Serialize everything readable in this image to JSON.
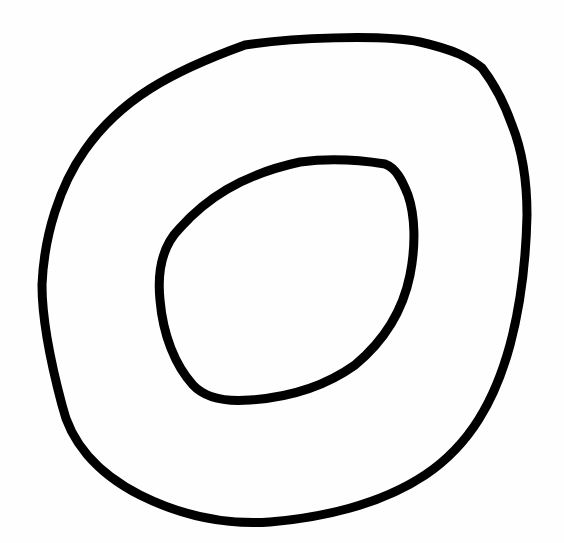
{
  "drawing": {
    "description": "Hand-drawn ring shape: two concentric irregular loops",
    "stroke_color": "#000000",
    "background_color": "#fefefe",
    "shapes": [
      {
        "name": "outer-loop"
      },
      {
        "name": "inner-loop"
      }
    ]
  }
}
